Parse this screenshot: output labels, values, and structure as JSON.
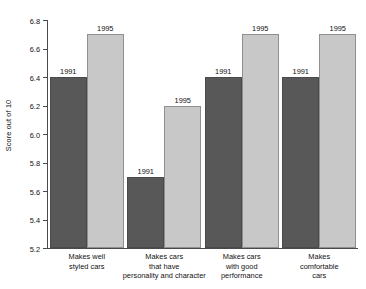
{
  "chart_data": {
    "type": "bar",
    "title": "",
    "xlabel": "",
    "ylabel": "Score out of 10",
    "ylim": [
      5.2,
      6.8
    ],
    "yticks": [
      "5.2",
      "5.4",
      "5.6",
      "5.8",
      "6.0",
      "6.2",
      "6.4",
      "6.6",
      "6.8"
    ],
    "grid": false,
    "legend": "none",
    "categories": [
      "Makes well\nstyled cars",
      "Makes cars\nthat have\npersonality and character",
      "Makes cars\nwith good\nperformance",
      "Makes\ncomfortable\ncars"
    ],
    "series": [
      {
        "name": "1991",
        "values": [
          6.4,
          5.7,
          6.4,
          6.4
        ],
        "color": "#585858"
      },
      {
        "name": "1995",
        "values": [
          6.7,
          6.2,
          6.7,
          6.7
        ],
        "color": "#c8c8c8"
      }
    ]
  },
  "axis": {
    "y_title": "Score out of 10"
  },
  "categories_lines": [
    [
      "Makes well",
      "styled cars"
    ],
    [
      "Makes cars",
      "that have",
      "personality and character"
    ],
    [
      "Makes cars",
      "with good",
      "performance"
    ],
    [
      "Makes",
      "comfortable",
      "cars"
    ]
  ],
  "bar_labels": {
    "y1991": "1991",
    "y1995": "1995"
  }
}
